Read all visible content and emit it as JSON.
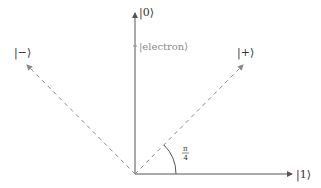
{
  "diagram": {
    "type": "qubit-basis-vectors",
    "labels": {
      "zero": "|0⟩",
      "one": "|1⟩",
      "plus": "|+⟩",
      "minus": "|−⟩",
      "electron": "|electron⟩",
      "angle_num": "π",
      "angle_den": "4"
    },
    "angle": "π/4",
    "colors": {
      "axis": "#555555",
      "dashed": "#888888",
      "text": "#333333",
      "electron_text": "#8a8a8a"
    }
  }
}
